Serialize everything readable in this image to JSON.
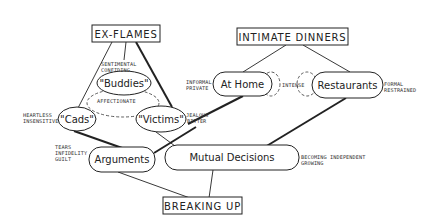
{
  "diagram": {
    "boxes": {
      "ex_flames": "EX-FLAMES",
      "intimate_dinners": "INTIMATE DINNERS",
      "breaking_up": "BREAKING UP"
    },
    "nodes": {
      "buddies": "\"Buddies\"",
      "cads": "\"Cads\"",
      "victims": "\"Victims\"",
      "arguments": "Arguments",
      "mutual_decisions": "Mutual Decisions",
      "at_home": "At Home",
      "restaurants": "Restaurants"
    },
    "annotations": {
      "sentimental": "SENTIMENTAL",
      "confiding": "CONFIDING",
      "affectionate": "AFFECTIONATE",
      "heartless": "HEARTLESS",
      "insensitive": "INSENSITIVE",
      "jealous": "JEALOUS",
      "bitter": "BITTER",
      "tears": "TEARS",
      "infidelity": "INFIDELITY",
      "guilt": "GUILT",
      "becoming_independent": "BECOMING INDEPENDENT",
      "growing": "GROWING",
      "informal": "INFORMAL",
      "private": "PRIVATE",
      "intense": "INTENSE",
      "formal": "FORMAL",
      "restrained": "RESTRAINED"
    }
  }
}
